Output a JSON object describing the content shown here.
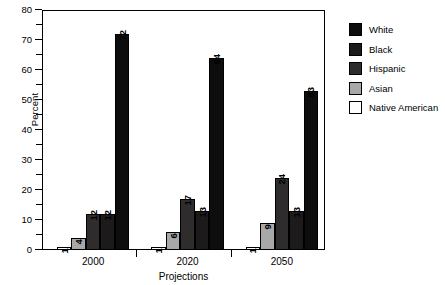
{
  "chart_data": {
    "type": "bar",
    "title": "",
    "xlabel": "Projections",
    "ylabel": "Percent",
    "categories": [
      "2000",
      "2020",
      "2050"
    ],
    "ylim": [
      0,
      80
    ],
    "y_ticks": [
      0,
      10,
      20,
      30,
      40,
      50,
      60,
      70,
      80
    ],
    "y_minor_ticks": [
      5,
      15,
      25,
      35,
      45,
      55,
      65,
      75
    ],
    "grid": false,
    "legend_position": "right",
    "series": [
      {
        "name": "White",
        "values": [
          72,
          64,
          53
        ],
        "color": "#0d0d0d"
      },
      {
        "name": "Black",
        "values": [
          12,
          13,
          13
        ],
        "color": "#1c1a1a"
      },
      {
        "name": "Hispanic",
        "values": [
          12,
          17,
          24
        ],
        "color": "#2e2c2c"
      },
      {
        "name": "Asian",
        "values": [
          4,
          6,
          9
        ],
        "color": "#a8a8a8"
      },
      {
        "name": "Native American",
        "values": [
          1,
          1,
          1
        ],
        "color": "#ffffff"
      }
    ],
    "bar_draw_order": [
      "Native American",
      "Asian",
      "Hispanic",
      "Black",
      "White"
    ]
  },
  "axes": {
    "y_title": "Percent",
    "x_title": "Projections",
    "y_tick_labels": [
      "0",
      "10",
      "20",
      "30",
      "40",
      "50",
      "60",
      "70",
      "80"
    ],
    "x_tick_labels": [
      "2000",
      "2020",
      "2050"
    ]
  },
  "legend": {
    "items": [
      {
        "label": "White",
        "swatch": "#0d0d0d"
      },
      {
        "label": "Black",
        "swatch": "#1c1a1a"
      },
      {
        "label": "Hispanic",
        "swatch": "#2e2c2c"
      },
      {
        "label": "Asian",
        "swatch": "#a8a8a8"
      },
      {
        "label": "Native American",
        "swatch": "#ffffff"
      }
    ]
  },
  "bar_value_labels": {
    "g2000": [
      "1",
      "4",
      "12",
      "12",
      "72"
    ],
    "g2020": [
      "1",
      "6",
      "17",
      "13",
      "64"
    ],
    "g2050": [
      "1",
      "9",
      "24",
      "13",
      "53"
    ]
  }
}
